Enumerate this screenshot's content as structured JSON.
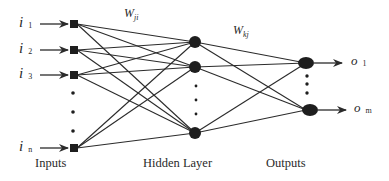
{
  "diagram": {
    "type": "neural-network",
    "colors": {
      "line": "#2b2b2b",
      "node": "#1e1e1e",
      "text": "#2a2a2a",
      "background": "#ffffff"
    },
    "inputs": [
      {
        "symbol": "i",
        "sub": "1"
      },
      {
        "symbol": "i",
        "sub": "2"
      },
      {
        "symbol": "i",
        "sub": "3"
      },
      {
        "symbol": "i",
        "sub": "n"
      }
    ],
    "outputs": [
      {
        "symbol": "o",
        "sub": "1"
      },
      {
        "symbol": "o",
        "sub": "m"
      }
    ],
    "weights": {
      "input_hidden": {
        "symbol": "W",
        "sub": "ji"
      },
      "hidden_output": {
        "symbol": "W",
        "sub": "kj"
      }
    },
    "captions": {
      "inputs": "Inputs",
      "hidden": "Hidden Layer",
      "outputs": "Outputs"
    }
  }
}
